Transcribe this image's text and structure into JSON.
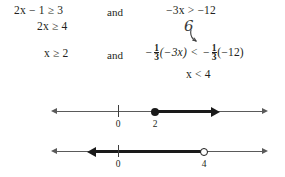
{
  "problem": {
    "type": "compound-inequality-solution",
    "conjunction_label": "and",
    "lines": [
      {
        "id": "line-1",
        "left": {
          "text": "2x − 1 ≥ 3",
          "lhs": "2x − 1",
          "relation": "≥",
          "rhs": "3"
        },
        "connector": "and",
        "right": {
          "text": "−3x > −12",
          "lhs": "−3x",
          "relation": ">",
          "rhs": "−12"
        }
      },
      {
        "id": "line-2",
        "left": {
          "text": "2x ≥ 4",
          "lhs": "2x",
          "relation": "≥",
          "rhs": "4"
        },
        "connector": "",
        "right": {
          "text": ""
        }
      },
      {
        "id": "line-3",
        "left": {
          "text": "x ≥ 2",
          "lhs": "x",
          "relation": "≥",
          "rhs": "2"
        },
        "connector": "and",
        "right": {
          "text": "−(1/3)(−3x) < −(1/3)(−12)",
          "lhs_sign": "−",
          "lhs_fraction": {
            "numerator": "1",
            "denominator": "3"
          },
          "lhs_paren": "(−3x)",
          "relation": "<",
          "rhs_sign": "−",
          "rhs_fraction": {
            "numerator": "1",
            "denominator": "3"
          },
          "rhs_paren": "(−12)"
        }
      },
      {
        "id": "line-4",
        "left": {
          "text": ""
        },
        "connector": "",
        "right": {
          "text": "x < 4",
          "lhs": "x",
          "relation": "<",
          "rhs": "4"
        }
      }
    ],
    "annotation": {
      "mark": "6",
      "description": "handwritten-six-with-arrow"
    }
  },
  "number_lines": [
    {
      "id": "numberline-1",
      "solution": "x ≥ 2",
      "ticks": [
        {
          "label": "0",
          "value": 0,
          "x_px": 118
        },
        {
          "label": "2",
          "value": 2,
          "x_px": 155
        }
      ],
      "endpoint": {
        "value": 2,
        "style": "closed-circle"
      },
      "ray_direction": "right",
      "axis_arrows": [
        "left",
        "right"
      ]
    },
    {
      "id": "numberline-2",
      "solution": "x < 4",
      "ticks": [
        {
          "label": "0",
          "value": 0,
          "x_px": 118
        },
        {
          "label": "4",
          "value": 4,
          "x_px": 204
        }
      ],
      "endpoint": {
        "value": 4,
        "style": "open-circle"
      },
      "ray_direction": "left",
      "axis_arrows": [
        "left",
        "right"
      ]
    }
  ],
  "colors": {
    "ink": "#231f20",
    "axis": "#5a5a5a",
    "bold_ray": "#1a1a1a",
    "background": "#ffffff",
    "annotation": "#3a3a3a"
  }
}
